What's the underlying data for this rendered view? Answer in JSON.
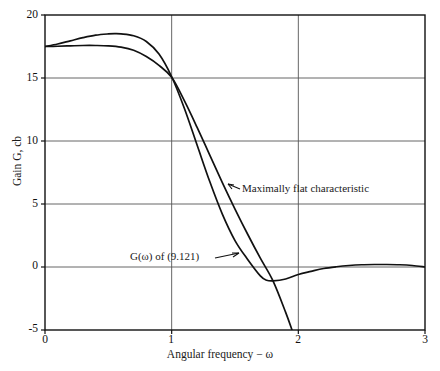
{
  "chart_data": {
    "type": "line",
    "title": "",
    "xlabel": "Angular frequency − ω",
    "ylabel": "Gain G, cb",
    "xlim": [
      0,
      3
    ],
    "ylim": [
      -5,
      20
    ],
    "xticks": [
      0,
      1,
      2,
      3
    ],
    "xtick_labels": [
      "0",
      "1",
      "2",
      "3"
    ],
    "yticks": [
      -5,
      0,
      5,
      10,
      15,
      20
    ],
    "ytick_labels": [
      "-5",
      "0",
      "5",
      "10",
      "15",
      "20"
    ],
    "grid": true,
    "legend_position": "none",
    "series": [
      {
        "name": "G(ω) of (9.121)",
        "x": [
          0.0,
          0.1,
          0.2,
          0.3,
          0.4,
          0.5,
          0.55,
          0.6,
          0.7,
          0.8,
          0.9,
          1.0,
          1.1,
          1.2,
          1.3,
          1.4,
          1.5,
          1.6,
          1.7,
          1.75,
          1.8,
          1.9,
          2.0,
          2.1,
          2.2,
          2.3,
          2.4,
          2.5,
          2.6,
          2.7,
          2.8,
          2.9,
          3.0
        ],
        "y": [
          17.5,
          17.7,
          17.95,
          18.2,
          18.4,
          18.5,
          18.52,
          18.5,
          18.35,
          17.9,
          16.9,
          15.1,
          12.6,
          9.7,
          6.8,
          4.2,
          2.1,
          0.6,
          -0.7,
          -1.05,
          -1.1,
          -0.95,
          -0.6,
          -0.35,
          -0.12,
          0.02,
          0.12,
          0.18,
          0.2,
          0.2,
          0.18,
          0.12,
          0.0
        ]
      },
      {
        "name": "Maximally flat characteristic",
        "x": [
          0.0,
          0.1,
          0.2,
          0.3,
          0.4,
          0.5,
          0.6,
          0.7,
          0.8,
          0.9,
          1.0,
          1.1,
          1.2,
          1.3,
          1.4,
          1.5,
          1.6,
          1.7,
          1.8,
          1.9,
          1.95
        ],
        "y": [
          17.5,
          17.52,
          17.55,
          17.58,
          17.58,
          17.55,
          17.45,
          17.2,
          16.7,
          16.0,
          15.05,
          13.2,
          11.1,
          8.9,
          6.7,
          4.6,
          2.6,
          0.7,
          -1.1,
          -3.6,
          -5.0
        ]
      }
    ],
    "annotations": [
      {
        "text": "Maximally flat characteristic",
        "target_series": "Maximally flat characteristic"
      },
      {
        "text": "G(ω) of (9.121)",
        "target_series": "G(ω) of (9.121)"
      }
    ]
  },
  "axis": {
    "x_title": "Angular frequency − ω",
    "y_title": "Gain G, cb",
    "xtick_0": "0",
    "xtick_1": "1",
    "xtick_2": "2",
    "xtick_3": "3",
    "ytick_20": "20",
    "ytick_15": "15",
    "ytick_10": "10",
    "ytick_5": "5",
    "ytick_0": "0",
    "ytick_m5": "-5"
  },
  "annotations": {
    "maximally_flat": "Maximally flat characteristic",
    "g_omega": "G(ω) of (9.121)"
  },
  "colors": {
    "line": "#111111",
    "grid": "#555555",
    "axis": "#111111",
    "background": "#ffffff"
  }
}
